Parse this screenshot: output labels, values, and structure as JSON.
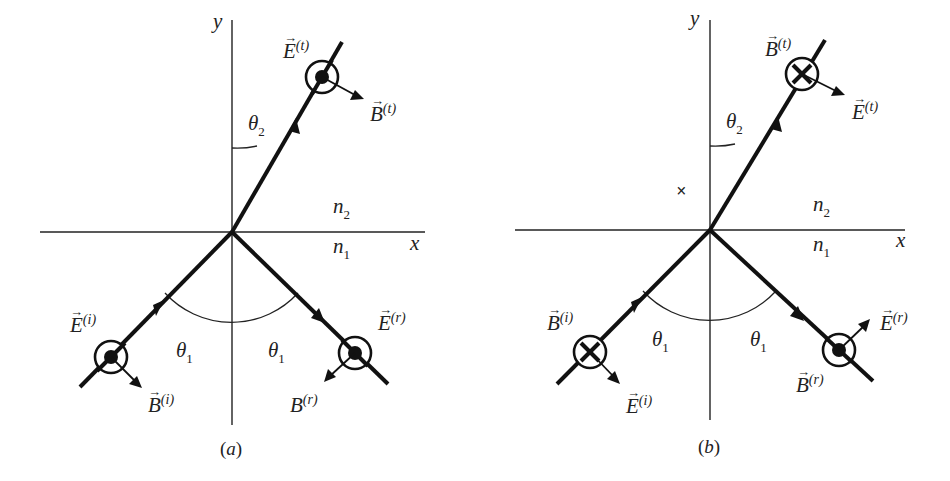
{
  "figure": {
    "panels": [
      {
        "caption": "(a)",
        "axes": {
          "x_label": "x",
          "y_label": "y"
        },
        "media": {
          "upper": "n₂",
          "lower": "n₁"
        },
        "angles": {
          "incidence": "θ₁",
          "reflection": "θ₁",
          "transmission": "θ₂"
        },
        "incident": {
          "E_label": "E",
          "E_sup": "(i)",
          "B_label": "B",
          "B_sup": "(i)",
          "E_symbol": "out-of-page (dot)"
        },
        "reflected": {
          "E_label": "E",
          "E_sup": "(r)",
          "B_label": "B",
          "B_sup": "(r)",
          "E_symbol": "out-of-page (dot)"
        },
        "transmitted": {
          "E_label": "E",
          "E_sup": "(t)",
          "B_label": "B",
          "B_sup": "(t)",
          "E_symbol": "out-of-page (dot)"
        }
      },
      {
        "caption": "(b)",
        "axes": {
          "x_label": "x",
          "y_label": "y"
        },
        "media": {
          "upper": "n₂",
          "lower": "n₁"
        },
        "angles": {
          "incidence": "θ₁",
          "reflection": "θ₁",
          "transmission": "θ₂"
        },
        "stray_mark": "×",
        "incident": {
          "B_label": "B",
          "B_sup": "(i)",
          "E_label": "E",
          "E_sup": "(i)",
          "B_symbol": "into-page (cross)"
        },
        "reflected": {
          "E_label": "E",
          "E_sup": "(r)",
          "B_label": "B",
          "B_sup": "(r)",
          "B_symbol": "out-of-page (dot)"
        },
        "transmitted": {
          "B_label": "B",
          "B_sup": "(t)",
          "E_label": "E",
          "E_sup": "(t)",
          "B_symbol": "into-page (cross)"
        }
      }
    ]
  }
}
